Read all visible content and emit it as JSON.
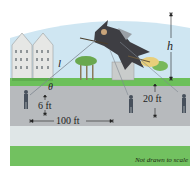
{
  "figure": {
    "labels": {
      "l": "l",
      "theta": "θ",
      "h": "h",
      "height_left": "6 ft",
      "height_right": "20 ft",
      "distance": "100 ft"
    },
    "note": "Not drawn to scale"
  },
  "colors": {
    "sky": "#c9e3f0",
    "grass": "#6cc05a",
    "road": "#b9bcbf",
    "sidewalk": "#dfe5e6",
    "strip": "#74c261",
    "building": "#e7e8e6",
    "witch": "#3e3e42"
  }
}
